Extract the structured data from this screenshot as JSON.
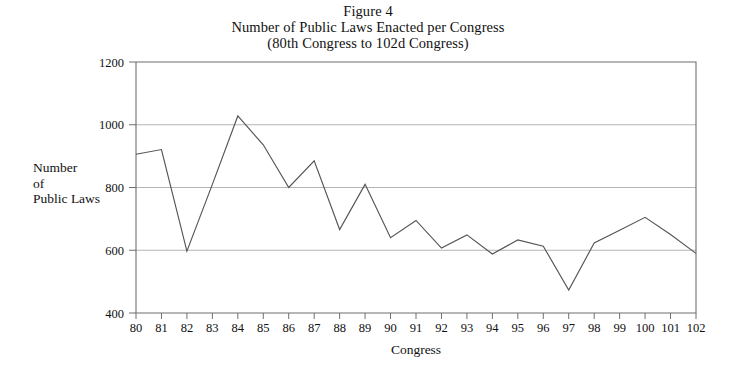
{
  "figure": {
    "title_lines": [
      "Figure 4",
      "Number of Public Laws Enacted per Congress",
      "(80th Congress to 102d Congress)"
    ],
    "ylabel_lines": [
      "Number",
      "of",
      "Public Laws"
    ],
    "xlabel": "Congress"
  },
  "chart_data": {
    "type": "line",
    "title": "Number of Public Laws Enacted per Congress (80th Congress to 102d Congress)",
    "subtitle": "Figure 4",
    "xlabel": "Congress",
    "ylabel": "Number of Public Laws",
    "categories": [
      "80",
      "81",
      "82",
      "83",
      "84",
      "85",
      "86",
      "87",
      "88",
      "89",
      "90",
      "91",
      "92",
      "93",
      "94",
      "95",
      "96",
      "97",
      "98",
      "99",
      "100",
      "101",
      "102"
    ],
    "values": [
      906,
      921,
      597,
      810,
      1028,
      936,
      800,
      885,
      666,
      810,
      640,
      695,
      607,
      649,
      588,
      633,
      613,
      473,
      623,
      664,
      705,
      650,
      590
    ],
    "series": [
      {
        "name": "Public laws enacted",
        "values": [
          906,
          921,
          597,
          810,
          1028,
          936,
          800,
          885,
          666,
          810,
          640,
          695,
          607,
          649,
          588,
          633,
          613,
          473,
          623,
          664,
          705,
          650,
          590
        ]
      }
    ],
    "xtick_labels": [
      "80",
      "81",
      "82",
      "83",
      "84",
      "85",
      "86",
      "87",
      "88",
      "89",
      "90",
      "91",
      "92",
      "93",
      "94",
      "95",
      "96",
      "97",
      "98",
      "99",
      "100",
      "101",
      "102"
    ],
    "ytick_labels": [
      "400",
      "600",
      "800",
      "1000",
      "1200"
    ],
    "ytick_values": [
      400,
      600,
      800,
      1000,
      1200
    ],
    "ylim": [
      400,
      1200
    ],
    "xlim": [
      "80",
      "102"
    ],
    "grid": "horizontal",
    "legend": "none",
    "line_color": "#555555",
    "grid_color": "#b4b4b4",
    "axis_color": "#6e6e6e"
  }
}
